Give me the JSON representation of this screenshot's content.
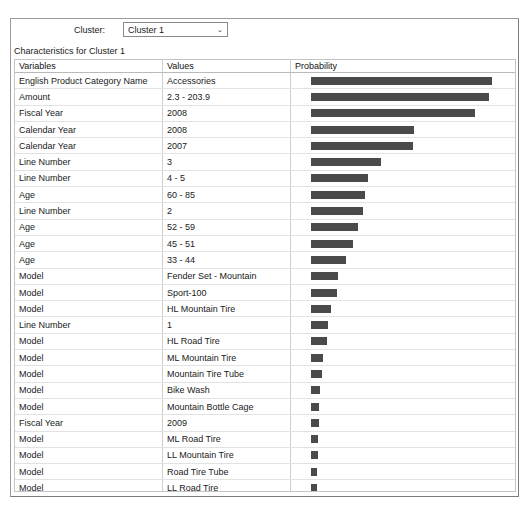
{
  "window": {
    "cluster_selector": {
      "label": "Cluster:",
      "value": "Cluster 1",
      "arrow_glyph": "⌄",
      "options": [
        "Cluster 1"
      ]
    },
    "caption": "Characteristics for Cluster 1"
  },
  "grid": {
    "columns": [
      "Variables",
      "Values",
      "Probability"
    ],
    "bar_color": "#4a4a4a",
    "rows": [
      {
        "variable": "English Product Category Name",
        "value": "Accessories",
        "bar_px": 181
      },
      {
        "variable": "Amount",
        "value": "2.3 - 203.9",
        "bar_px": 178
      },
      {
        "variable": "Fiscal Year",
        "value": "2008",
        "bar_px": 164
      },
      {
        "variable": "Calendar Year",
        "value": "2008",
        "bar_px": 103
      },
      {
        "variable": "Calendar Year",
        "value": "2007",
        "bar_px": 102
      },
      {
        "variable": "Line Number",
        "value": "3",
        "bar_px": 70
      },
      {
        "variable": "Line Number",
        "value": "4 - 5",
        "bar_px": 57
      },
      {
        "variable": "Age",
        "value": "60 - 85",
        "bar_px": 54
      },
      {
        "variable": "Line Number",
        "value": "2",
        "bar_px": 52
      },
      {
        "variable": "Age",
        "value": "52 - 59",
        "bar_px": 47
      },
      {
        "variable": "Age",
        "value": "45 - 51",
        "bar_px": 42
      },
      {
        "variable": "Age",
        "value": "33 - 44",
        "bar_px": 35
      },
      {
        "variable": "Model",
        "value": "Fender Set - Mountain",
        "bar_px": 27
      },
      {
        "variable": "Model",
        "value": "Sport-100",
        "bar_px": 26
      },
      {
        "variable": "Model",
        "value": "HL Mountain Tire",
        "bar_px": 20
      },
      {
        "variable": "Line Number",
        "value": "1",
        "bar_px": 17
      },
      {
        "variable": "Model",
        "value": "HL Road Tire",
        "bar_px": 16
      },
      {
        "variable": "Model",
        "value": "ML Mountain Tire",
        "bar_px": 12
      },
      {
        "variable": "Model",
        "value": "Mountain Tire Tube",
        "bar_px": 11
      },
      {
        "variable": "Model",
        "value": "Bike Wash",
        "bar_px": 9
      },
      {
        "variable": "Model",
        "value": "Mountain Bottle Cage",
        "bar_px": 8
      },
      {
        "variable": "Fiscal Year",
        "value": "2009",
        "bar_px": 8
      },
      {
        "variable": "Model",
        "value": "ML Road Tire",
        "bar_px": 7
      },
      {
        "variable": "Model",
        "value": "LL Mountain Tire",
        "bar_px": 7
      },
      {
        "variable": "Model",
        "value": "Road Tire Tube",
        "bar_px": 6
      },
      {
        "variable": "Model",
        "value": "LL Road Tire",
        "bar_px": 6
      },
      {
        "variable": "Model",
        "value": "Hydration Pack",
        "bar_px": 5
      },
      {
        "variable": "Model",
        "value": "Patch kit",
        "bar_px": 2
      },
      {
        "variable": "Model",
        "value": "Road Bottle Cage",
        "bar_px": 2
      }
    ]
  }
}
